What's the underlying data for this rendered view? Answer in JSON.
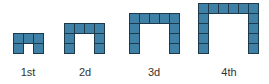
{
  "colors": {
    "fill": "#3f80a6",
    "stroke": "#1c3a4a",
    "label": "#333333"
  },
  "cell_size": 10,
  "baseline_y": 53,
  "figures": [
    {
      "label": "1st",
      "width": 3,
      "height": 2,
      "x": 13,
      "label_cx": 28
    },
    {
      "label": "2d",
      "width": 4,
      "height": 3,
      "x": 64,
      "label_cx": 85
    },
    {
      "label": "3d",
      "width": 5,
      "height": 4,
      "x": 129,
      "label_cx": 154
    },
    {
      "label": "4th",
      "width": 6,
      "height": 5,
      "x": 198,
      "label_cx": 229
    }
  ],
  "label_y": 66
}
